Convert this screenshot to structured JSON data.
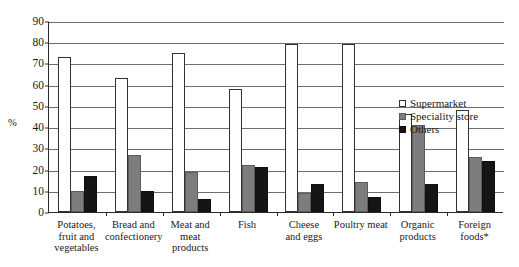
{
  "chart_data": {
    "type": "bar",
    "title": "",
    "xlabel": "",
    "ylabel": "%",
    "ylim": [
      0,
      90
    ],
    "yticks": [
      0,
      10,
      20,
      30,
      40,
      50,
      60,
      70,
      80,
      90
    ],
    "grid": true,
    "legend_position": "right-middle",
    "categories": [
      "Potatoes, fruit and vegetables",
      "Bread and confectionery",
      "Meat and meat products",
      "Fish",
      "Cheese and eggs",
      "Poultry meat",
      "Organic products",
      "Foreign foods*"
    ],
    "category_lines": [
      [
        "Potatoes,",
        "fruit and",
        "vegetables"
      ],
      [
        "Bread and",
        "confectionery"
      ],
      [
        "Meat and",
        "meat",
        "products"
      ],
      [
        "Fish"
      ],
      [
        "Cheese",
        "and eggs"
      ],
      [
        "Poultry meat"
      ],
      [
        "Organic",
        "products"
      ],
      [
        "Foreign",
        "foods*"
      ]
    ],
    "series": [
      {
        "name": "Supermarket",
        "color": "#ffffff",
        "values": [
          73,
          63,
          75,
          58,
          79,
          79,
          46,
          48
        ]
      },
      {
        "name": "Speciality store",
        "color": "#7d7d7d",
        "values": [
          10,
          27,
          19,
          22,
          9,
          14,
          41,
          26
        ]
      },
      {
        "name": "Others",
        "color": "#151515",
        "values": [
          17,
          10,
          6,
          21,
          13,
          7,
          13,
          24
        ]
      }
    ]
  },
  "legend": {
    "items": [
      {
        "label": "Supermarket",
        "key": "supermarket"
      },
      {
        "label": "Speciality store",
        "key": "speciality"
      },
      {
        "label": "Others",
        "key": "others"
      }
    ]
  }
}
